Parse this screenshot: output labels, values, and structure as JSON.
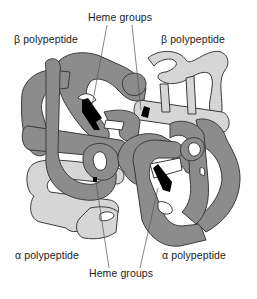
{
  "figure": {
    "labels": {
      "heme_top": "Heme groups",
      "heme_bottom": "Heme groups",
      "beta_left": "β polypeptide",
      "beta_right": "β polypeptide",
      "alpha_left": "α polypeptide",
      "alpha_right": "α polypeptide"
    },
    "colors": {
      "dark_chain": "#8c8c8c",
      "light_chain": "#d6d6d6",
      "heme": "#000000",
      "outline": "#3a3a3a",
      "leader_line": "#555555",
      "background": "#ffffff"
    },
    "subunits": [
      {
        "name": "β polypeptide",
        "position": "top-left",
        "shade": "dark"
      },
      {
        "name": "β polypeptide",
        "position": "top-right",
        "shade": "light"
      },
      {
        "name": "α polypeptide",
        "position": "bottom-left",
        "shade": "light"
      },
      {
        "name": "α polypeptide",
        "position": "bottom-right",
        "shade": "dark"
      }
    ]
  }
}
